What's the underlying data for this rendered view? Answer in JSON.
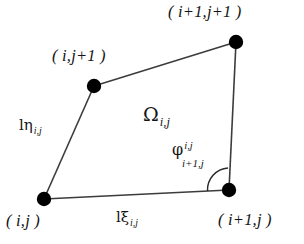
{
  "figure": {
    "type": "quadrilateral-cell-diagram",
    "background_color": "#ffffff",
    "line_color": "#3c3c3c",
    "vertex_color": "#000000",
    "text_color": "#141414",
    "width": 304,
    "height": 244
  },
  "vertices": {
    "bottom_left": {
      "label_prefix": "( ",
      "label_core": "i,j",
      "label_suffix": " )",
      "x": 44,
      "y": 199
    },
    "bottom_right": {
      "label_prefix": "( ",
      "label_core": "i+1,j",
      "label_suffix": " )",
      "x": 229,
      "y": 190
    },
    "top_left": {
      "label_prefix": "( ",
      "label_core": "i,j+1",
      "label_suffix": " )",
      "x": 94,
      "y": 86
    },
    "top_right": {
      "label_prefix": "( ",
      "label_core": "i+1,j+1",
      "label_suffix": " )",
      "x": 236,
      "y": 42
    }
  },
  "labels": {
    "vertex_bottom_left": "( i,j )",
    "vertex_bottom_right": "( i+1,j )",
    "vertex_top_left": "( i,j+1 )",
    "vertex_top_right": "( i+1,j+1 )",
    "edge_bottom_symbol": "lξ",
    "edge_bottom_sub": "i,j",
    "edge_left_symbol": "lη",
    "edge_left_sub": "i,j",
    "region_symbol": "Ω",
    "region_sub": "i,j",
    "angle_symbol": "φ",
    "angle_sup": "i,j",
    "angle_sub": "i+1,j"
  },
  "edges": [
    {
      "name": "bottom-edge",
      "from": "bottom_left",
      "to": "bottom_right",
      "label": "lξ i,j"
    },
    {
      "name": "left-edge",
      "from": "bottom_left",
      "to": "top_left",
      "label": "lη i,j"
    },
    {
      "name": "top-edge",
      "from": "top_left",
      "to": "top_right",
      "label": ""
    },
    {
      "name": "right-edge",
      "from": "top_right",
      "to": "bottom_right",
      "label": ""
    }
  ],
  "angle_arc": {
    "name": "interior-angle-arc",
    "at_vertex": "bottom_right",
    "between_edges": [
      "bottom-edge",
      "right-edge"
    ]
  }
}
